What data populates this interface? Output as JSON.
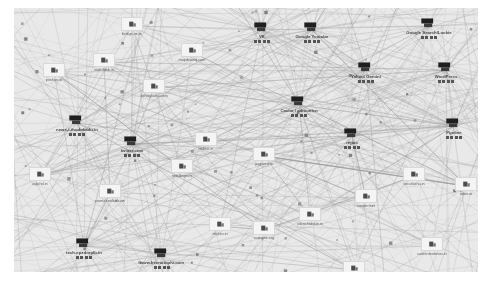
{
  "view": {
    "title": "web tracking network graph",
    "canvas": {
      "x": 14,
      "y": 8,
      "width": 464,
      "height": 264,
      "background": "#e9e9e9",
      "edge_color": "#9a9a9a",
      "page_background": "#ffffff"
    }
  },
  "nodes": [
    {
      "id": "n01",
      "label": "bridge-vn.in",
      "x": 118,
      "y": 18,
      "size": "small",
      "icon": "favicon-box"
    },
    {
      "id": "n02",
      "label": "mapdisanq.com",
      "x": 178,
      "y": 44,
      "size": "small",
      "icon": "favicon-box"
    },
    {
      "id": "n03",
      "label": "VK",
      "x": 248,
      "y": 22,
      "size": "hub",
      "icon": "brand-mark"
    },
    {
      "id": "n04",
      "label": "Google Youtube",
      "x": 298,
      "y": 22,
      "size": "hub",
      "icon": "brand-mark"
    },
    {
      "id": "n05",
      "label": "Google Search/Lookie",
      "x": 415,
      "y": 18,
      "size": "hub",
      "icon": "brand-mark"
    },
    {
      "id": "n06",
      "label": "Yahoo/ Gemini",
      "x": 352,
      "y": 62,
      "size": "hub",
      "icon": "brand-mark"
    },
    {
      "id": "n07",
      "label": "WordPress",
      "x": 432,
      "y": 62,
      "size": "hub",
      "icon": "brand-mark"
    },
    {
      "id": "n08",
      "label": "pxsharr.in",
      "x": 40,
      "y": 64,
      "size": "small",
      "icon": "favicon-box"
    },
    {
      "id": "n09",
      "label": "wae-fabb.in",
      "x": 90,
      "y": 54,
      "size": "small",
      "icon": "favicon-box"
    },
    {
      "id": "n10",
      "label": "sohogoarta.com",
      "x": 140,
      "y": 80,
      "size": "small",
      "icon": "favicon-box"
    },
    {
      "id": "n11",
      "label": "Casior / aditionlen",
      "x": 285,
      "y": 96,
      "size": "hub",
      "icon": "brand-mark"
    },
    {
      "id": "n12",
      "label": "news-i-thodokadu.in",
      "x": 63,
      "y": 115,
      "size": "hub",
      "icon": "brand-mark"
    },
    {
      "id": "n13",
      "label": "twitter.com",
      "x": 118,
      "y": 136,
      "size": "hub",
      "icon": "brand-mark"
    },
    {
      "id": "n14",
      "label": "nsfline.in",
      "x": 192,
      "y": 133,
      "size": "small",
      "icon": "favicon-box"
    },
    {
      "id": "n15",
      "label": "jaxpertw.in",
      "x": 250,
      "y": 148,
      "size": "small",
      "icon": "favicon-box"
    },
    {
      "id": "n16",
      "label": "rejtoc",
      "x": 338,
      "y": 128,
      "size": "hub",
      "icon": "brand-mark"
    },
    {
      "id": "n17",
      "label": "Pipdine",
      "x": 440,
      "y": 118,
      "size": "hub",
      "icon": "brand-mark"
    },
    {
      "id": "n18",
      "label": "sotelbrgines",
      "x": 168,
      "y": 160,
      "size": "small",
      "icon": "favicon-box"
    },
    {
      "id": "n19",
      "label": "secutlathu.in",
      "x": 400,
      "y": 168,
      "size": "small",
      "icon": "favicon-box"
    },
    {
      "id": "n20",
      "label": "tuber.at",
      "x": 452,
      "y": 178,
      "size": "small",
      "icon": "favicon-box"
    },
    {
      "id": "n21",
      "label": "www.ceonlan.com",
      "x": 96,
      "y": 185,
      "size": "small",
      "icon": "favicon-box"
    },
    {
      "id": "n22",
      "label": "cander.bet",
      "x": 352,
      "y": 190,
      "size": "small",
      "icon": "favicon-box"
    },
    {
      "id": "n23",
      "label": "sdohin.in",
      "x": 206,
      "y": 218,
      "size": "small",
      "icon": "favicon-box"
    },
    {
      "id": "n24",
      "label": "camqwe.org",
      "x": 250,
      "y": 222,
      "size": "small",
      "icon": "favicon-box"
    },
    {
      "id": "n25",
      "label": "rabrichtdskie.in",
      "x": 296,
      "y": 208,
      "size": "small",
      "icon": "favicon-box"
    },
    {
      "id": "n26",
      "label": "corkenterdetoo.in",
      "x": 418,
      "y": 238,
      "size": "small",
      "icon": "favicon-box"
    },
    {
      "id": "n27",
      "label": "ban-reep.com",
      "x": 340,
      "y": 262,
      "size": "small",
      "icon": "favicon-box"
    },
    {
      "id": "n28",
      "label": "www.keenotophi.com",
      "x": 148,
      "y": 248,
      "size": "hub",
      "icon": "brand-mark"
    },
    {
      "id": "n29",
      "label": "tech-epzdorplb.in",
      "x": 70,
      "y": 238,
      "size": "hub",
      "icon": "brand-mark"
    },
    {
      "id": "n30",
      "label": "aglohd.in",
      "x": 26,
      "y": 168,
      "size": "small",
      "icon": "favicon-box"
    }
  ]
}
